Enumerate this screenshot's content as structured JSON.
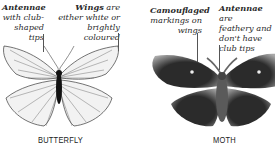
{
  "butterfly": {
    "caption_antennae": {
      "bold": "Antennae",
      "rest_lines": [
        "with club-",
        "shaped tips"
      ]
    },
    "caption_wings": {
      "bold": "Wings",
      "first_rest": " are",
      "rest_lines": [
        "either white or",
        "brightly coloured"
      ]
    },
    "label": "BUTTERFLY"
  },
  "moth": {
    "caption_markings": {
      "bold": "Camouflaged",
      "rest_lines": [
        "markings on",
        "wings"
      ]
    },
    "caption_antennae": {
      "bold": "Antennae",
      "first_rest": " are",
      "rest_lines": [
        "feathery and",
        "don't have",
        "club tips"
      ]
    },
    "label": "MOTH"
  },
  "colors": {
    "moth_dark": "#2b2b2b",
    "moth_light": "#a9a9a9",
    "butterfly_wing": "#f2f2f2",
    "vein": "#3a3a3a"
  }
}
